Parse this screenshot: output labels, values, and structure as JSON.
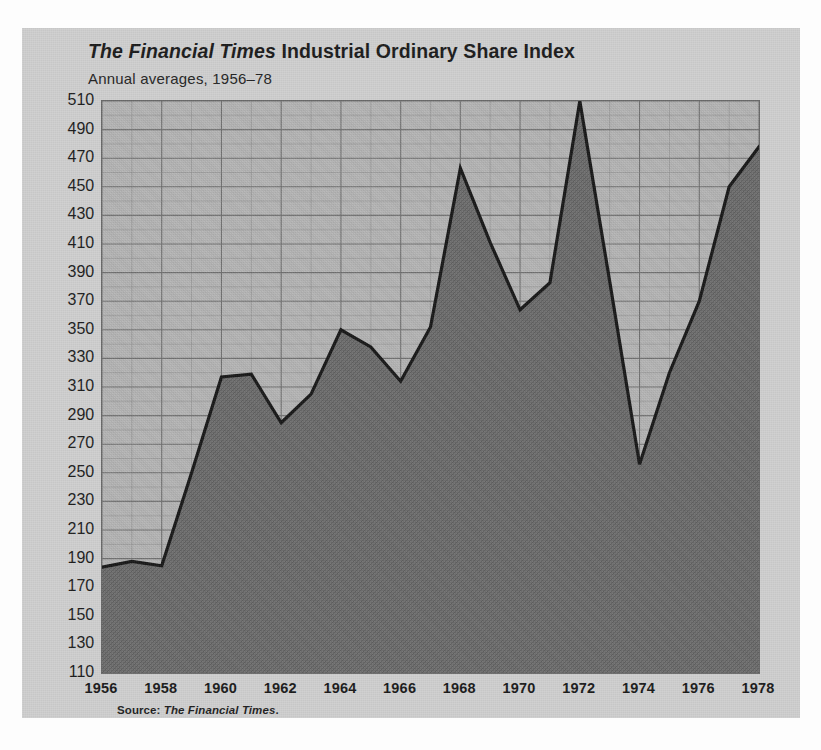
{
  "figure": {
    "title_lead": "The Financial Times",
    "title_rest": " Industrial Ordinary Share Index",
    "subtitle": "Annual averages, 1956–78",
    "source_label": "Source: ",
    "source_name": "The Financial Times",
    "source_period": "."
  },
  "colors": {
    "page_background": "#fdfdfd",
    "card_background": "#cfcfcf",
    "plot_background": "#b5b5b5",
    "grid_line": "#6f6f6f",
    "grid_line_minor": "#8a8a8a",
    "area_fill": "#6e6e6e",
    "series_line": "#161616",
    "text": "#1b1b1b"
  },
  "chart_data": {
    "type": "area",
    "title": "The Financial Times Industrial Ordinary Share Index",
    "subtitle": "Annual averages, 1956–78",
    "xlabel": "",
    "ylabel": "",
    "xlim": [
      1956,
      1978
    ],
    "ylim": [
      110,
      510
    ],
    "grid": true,
    "legend": "none",
    "y_tick_step": 20,
    "x_tick_step": 2,
    "x_minor_step": 1,
    "y_ticks": [
      510,
      490,
      470,
      450,
      430,
      410,
      390,
      370,
      350,
      330,
      310,
      290,
      270,
      250,
      230,
      210,
      190,
      170,
      150,
      130,
      110
    ],
    "x_ticks": [
      1956,
      1958,
      1960,
      1962,
      1964,
      1966,
      1968,
      1970,
      1972,
      1974,
      1976,
      1978
    ],
    "x": [
      1956,
      1957,
      1958,
      1959,
      1960,
      1961,
      1962,
      1963,
      1964,
      1965,
      1966,
      1967,
      1968,
      1969,
      1970,
      1971,
      1972,
      1973,
      1974,
      1975,
      1976,
      1977,
      1978
    ],
    "values": [
      184,
      188,
      185,
      250,
      317,
      319,
      285,
      305,
      350,
      338,
      314,
      352,
      463,
      411,
      364,
      383,
      510,
      384,
      256,
      320,
      370,
      450,
      478
    ],
    "series": [
      {
        "name": "FT Industrial Ordinary Share Index",
        "values": [
          184,
          188,
          185,
          250,
          317,
          319,
          285,
          305,
          350,
          338,
          314,
          352,
          463,
          411,
          364,
          383,
          510,
          384,
          256,
          320,
          370,
          450,
          478
        ]
      }
    ]
  }
}
